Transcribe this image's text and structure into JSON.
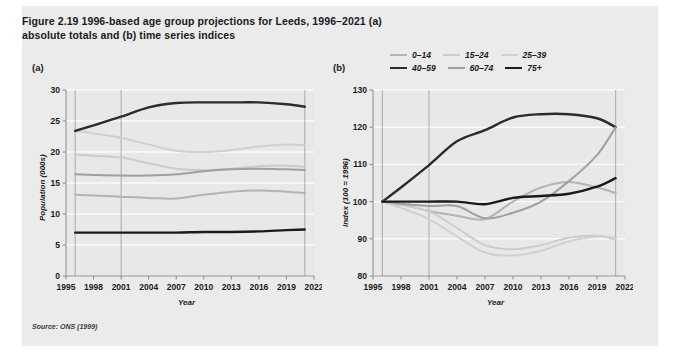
{
  "figure": {
    "title": "Figure 2.19  1996-based age group projections for Leeds, 1996–2021 (a) absolute totals and (b) time series indices",
    "source": "Source: ONS (1999)",
    "panel_a_letter": "(a)",
    "panel_b_letter": "(b)",
    "background": "#ebebeb"
  },
  "legend": {
    "rows": [
      [
        {
          "label": "0–14",
          "color": "#b3b3b3",
          "width": 2.0
        },
        {
          "label": "15–24",
          "color": "#cccccc",
          "width": 2.0
        },
        {
          "label": "25–39",
          "color": "#d0d0d0",
          "width": 2.0
        }
      ],
      [
        {
          "label": "40–59",
          "color": "#2b2b2b",
          "width": 2.4
        },
        {
          "label": "60–74",
          "color": "#a0a0a0",
          "width": 2.0
        },
        {
          "label": "75+",
          "color": "#1a1a1a",
          "width": 2.4
        }
      ]
    ]
  },
  "chart_data": [
    {
      "type": "line",
      "panel": "(a)",
      "title": "1996-based age group projections for Leeds, absolute totals",
      "xlabel": "Year",
      "ylabel": "Population (000s)",
      "xlim": [
        1995,
        2022
      ],
      "ylim": [
        0,
        30
      ],
      "yticks": [
        0,
        5,
        10,
        15,
        20,
        25,
        30
      ],
      "xticks": [
        1995,
        1998,
        2001,
        2004,
        2007,
        2010,
        2013,
        2016,
        2019,
        2022
      ],
      "grid": "horizontal-white",
      "reference_lines": [
        1996,
        2001,
        2021
      ],
      "x": [
        1996,
        1998,
        2001,
        2004,
        2007,
        2010,
        2013,
        2016,
        2019,
        2021
      ],
      "series": [
        {
          "name": "0–14",
          "color": "#b3b3b3",
          "width": 2.0,
          "values": [
            13.1,
            13.0,
            12.8,
            12.6,
            12.5,
            13.1,
            13.6,
            13.8,
            13.6,
            13.4
          ]
        },
        {
          "name": "15–24",
          "color": "#cccccc",
          "width": 2.0,
          "values": [
            19.6,
            19.4,
            19.1,
            18.2,
            17.3,
            17.1,
            17.3,
            17.7,
            17.8,
            17.6
          ]
        },
        {
          "name": "25–39",
          "color": "#d0d0d0",
          "width": 2.0,
          "values": [
            23.4,
            23.0,
            22.3,
            21.2,
            20.2,
            20.0,
            20.3,
            20.9,
            21.2,
            21.1
          ]
        },
        {
          "name": "40–59",
          "color": "#2b2b2b",
          "width": 2.4,
          "values": [
            23.4,
            24.3,
            25.7,
            27.2,
            27.9,
            28.0,
            28.0,
            28.0,
            27.7,
            27.3
          ]
        },
        {
          "name": "60–74",
          "color": "#a0a0a0",
          "width": 2.0,
          "values": [
            16.4,
            16.3,
            16.2,
            16.2,
            16.4,
            16.9,
            17.2,
            17.3,
            17.2,
            17.1
          ]
        },
        {
          "name": "75+",
          "color": "#1a1a1a",
          "width": 2.4,
          "values": [
            7.0,
            7.0,
            7.0,
            7.0,
            7.0,
            7.1,
            7.1,
            7.2,
            7.4,
            7.5
          ]
        }
      ]
    },
    {
      "type": "line",
      "panel": "(b)",
      "title": "1996-based age group projections for Leeds, time series indices",
      "xlabel": "Year",
      "ylabel": "Index (100 = 1996)",
      "xlim": [
        1995,
        2022
      ],
      "ylim": [
        80,
        130
      ],
      "yticks": [
        80,
        90,
        100,
        110,
        120,
        130
      ],
      "xticks": [
        1995,
        1998,
        2001,
        2004,
        2007,
        2010,
        2013,
        2016,
        2019,
        2022
      ],
      "grid": "horizontal-white",
      "reference_lines": [
        1996,
        2001,
        2021
      ],
      "x": [
        1996,
        1998,
        2001,
        2004,
        2007,
        2010,
        2013,
        2016,
        2019,
        2021
      ],
      "series": [
        {
          "name": "0–14",
          "color": "#b3b3b3",
          "width": 2.0,
          "values": [
            100,
            99.3,
            97.5,
            96.2,
            95.3,
            100.0,
            103.8,
            105.3,
            103.8,
            102.3
          ]
        },
        {
          "name": "15–24",
          "color": "#cccccc",
          "width": 2.0,
          "values": [
            100,
            99.0,
            97.4,
            92.9,
            88.3,
            87.2,
            88.3,
            90.3,
            90.8,
            89.8
          ]
        },
        {
          "name": "25–39",
          "color": "#d0d0d0",
          "width": 2.0,
          "values": [
            100,
            98.3,
            95.3,
            90.6,
            86.3,
            85.5,
            86.8,
            89.3,
            90.6,
            90.2
          ]
        },
        {
          "name": "40–59",
          "color": "#2b2b2b",
          "width": 2.4,
          "values": [
            100,
            103.8,
            109.8,
            116.2,
            119.2,
            122.6,
            123.5,
            123.5,
            122.4,
            120.0
          ]
        },
        {
          "name": "60–74",
          "color": "#a0a0a0",
          "width": 2.0,
          "values": [
            100,
            99.4,
            98.8,
            98.8,
            95.5,
            97.0,
            100.0,
            105.5,
            112.5,
            120.0
          ]
        },
        {
          "name": "75+",
          "color": "#1a1a1a",
          "width": 2.4,
          "values": [
            100,
            100.0,
            100.0,
            100.0,
            99.3,
            101.0,
            101.5,
            102.1,
            104.0,
            106.3
          ]
        }
      ]
    }
  ]
}
